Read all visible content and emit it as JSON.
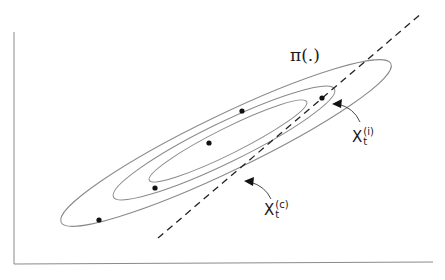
{
  "diagram": {
    "title_label": "π(.)",
    "label_i": {
      "base": "X",
      "sup": "(i)",
      "sub": "t"
    },
    "label_c": {
      "base": "X",
      "sup": "(c)",
      "sub": "t"
    },
    "colors": {
      "contour": "#8a8a8a",
      "axis": "#8a8a8a",
      "dashed": "#222222",
      "dot": "#111111",
      "arrow": "#333333"
    },
    "ellipses": [
      {
        "name": "inner",
        "cx": 228,
        "cy": 141,
        "rx": 88,
        "ry": 13,
        "angle": -26.5
      },
      {
        "name": "middle",
        "cx": 224,
        "cy": 143,
        "rx": 123,
        "ry": 20,
        "angle": -26.0
      },
      {
        "name": "outer",
        "cx": 226,
        "cy": 143,
        "rx": 183,
        "ry": 28,
        "angle": -25.7
      }
    ],
    "points": [
      {
        "x": 99,
        "y": 220
      },
      {
        "x": 155,
        "y": 188
      },
      {
        "x": 209,
        "y": 143
      },
      {
        "x": 242,
        "y": 111
      },
      {
        "x": 322,
        "y": 98
      }
    ],
    "dashed_line": {
      "x1": 158,
      "y1": 238,
      "x2": 422,
      "y2": 13
    }
  }
}
